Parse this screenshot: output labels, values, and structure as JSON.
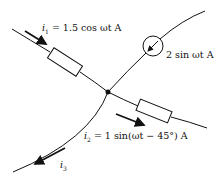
{
  "diagram": {
    "type": "circuit-node",
    "node": {
      "name": "junction",
      "x": 108,
      "y": 92
    },
    "branches": [
      {
        "id": "branch-1",
        "element": "resistor",
        "current_label": "i1 = 1.5 cos ωt A",
        "current_symbol": "i1",
        "current_expr": "1.5 cos ωt A",
        "arrow_direction": "toward-node"
      },
      {
        "id": "branch-source",
        "element": "current-source",
        "current_label": "2 sin ωt A",
        "arrow_direction": "toward-node"
      },
      {
        "id": "branch-2",
        "element": "resistor",
        "current_label": "i2 = 1 sin(ωt − 45°) A",
        "current_symbol": "i2",
        "current_expr": "1 sin(ωt − 45°) A",
        "arrow_direction": "away-from-node"
      },
      {
        "id": "branch-3",
        "element": "wire",
        "current_label": "i3",
        "current_symbol": "i3",
        "arrow_direction": "away-from-node"
      }
    ]
  },
  "labels": {
    "i1_sym": "i",
    "i1_sub": "1",
    "i1_rest": " = 1.5 cos ωt A",
    "src": "2 sin ωt A",
    "i2_sym": "i",
    "i2_sub": "2",
    "i2_rest": " = 1 sin(ωt − 45°) A",
    "i3_sym": "i",
    "i3_sub": "3"
  },
  "colors": {
    "line": "#111111",
    "background": "#ffffff"
  }
}
